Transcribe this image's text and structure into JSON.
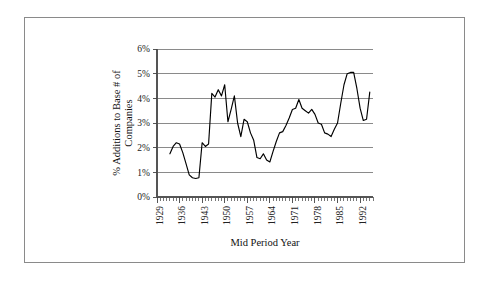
{
  "chart_data": {
    "type": "line",
    "title": "",
    "xlabel": "Mid Period Year",
    "ylabel": "% Additions to Base # of Companies",
    "xlim": [
      1929,
      1996
    ],
    "ylim": [
      0,
      6
    ],
    "grid": true,
    "legend": false,
    "y_ticks": [
      "0%",
      "1%",
      "2%",
      "3%",
      "4%",
      "5%",
      "6%"
    ],
    "y_tick_values": [
      0,
      1,
      2,
      3,
      4,
      5,
      6
    ],
    "x_ticks": [
      "1929",
      "1936",
      "1943",
      "1950",
      "1957",
      "1964",
      "1971",
      "1978",
      "1985",
      "1992"
    ],
    "x_tick_values": [
      1929,
      1936,
      1943,
      1950,
      1957,
      1964,
      1971,
      1978,
      1985,
      1992
    ],
    "x_minor_tick_step": 1,
    "series_color": "#000000",
    "x": [
      1933,
      1934,
      1935,
      1936,
      1937,
      1938,
      1939,
      1940,
      1941,
      1942,
      1943,
      1944,
      1945,
      1946,
      1947,
      1948,
      1949,
      1950,
      1951,
      1952,
      1953,
      1954,
      1955,
      1956,
      1957,
      1958,
      1959,
      1960,
      1961,
      1962,
      1963,
      1964,
      1965,
      1966,
      1967,
      1968,
      1969,
      1970,
      1971,
      1972,
      1973,
      1974,
      1975,
      1976,
      1977,
      1978,
      1979,
      1980,
      1981,
      1982,
      1983,
      1984,
      1985,
      1986,
      1987,
      1988,
      1989,
      1990,
      1991,
      1992,
      1993,
      1994,
      1995
    ],
    "values": [
      1.75,
      2.05,
      2.2,
      2.15,
      1.8,
      1.35,
      0.9,
      0.78,
      0.75,
      0.78,
      2.2,
      2.05,
      2.15,
      4.2,
      4.05,
      4.35,
      4.1,
      4.55,
      3.05,
      3.55,
      4.1,
      3.0,
      2.45,
      3.15,
      3.05,
      2.6,
      2.3,
      1.6,
      1.55,
      1.75,
      1.5,
      1.42,
      1.85,
      2.25,
      2.6,
      2.65,
      2.9,
      3.2,
      3.55,
      3.6,
      3.95,
      3.6,
      3.5,
      3.4,
      3.55,
      3.35,
      3.0,
      2.95,
      2.6,
      2.55,
      2.45,
      2.75,
      3.0,
      3.8,
      4.55,
      5.0,
      5.05,
      5.05,
      4.4,
      3.6,
      3.1,
      3.15,
      4.25
    ],
    "series": [
      {
        "name": "% Additions to Base # of Companies",
        "values": [
          1.75,
          2.05,
          2.2,
          2.15,
          1.8,
          1.35,
          0.9,
          0.78,
          0.75,
          0.78,
          2.2,
          2.05,
          2.15,
          4.2,
          4.05,
          4.35,
          4.1,
          4.55,
          3.05,
          3.55,
          4.1,
          3.0,
          2.45,
          3.15,
          3.05,
          2.6,
          2.3,
          1.6,
          1.55,
          1.75,
          1.5,
          1.42,
          1.85,
          2.25,
          2.6,
          2.65,
          2.9,
          3.2,
          3.55,
          3.6,
          3.95,
          3.6,
          3.5,
          3.4,
          3.55,
          3.35,
          3.0,
          2.95,
          2.6,
          2.55,
          2.45,
          2.75,
          3.0,
          3.8,
          4.55,
          5.0,
          5.05,
          5.05,
          4.4,
          3.6,
          3.1,
          3.15,
          4.25
        ]
      }
    ]
  },
  "axis": {
    "ylabel_line1": "% Additions to Base # of",
    "ylabel_line2": "Companies",
    "xlabel": "Mid Period Year"
  }
}
